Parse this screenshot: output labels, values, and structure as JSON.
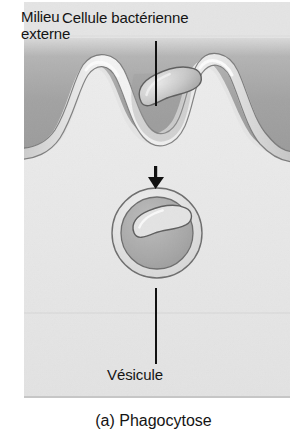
{
  "figure": {
    "name": "phagocytosis-diagram",
    "caption": "(a) Phagocytose",
    "panel": {
      "background_color": "#dedede",
      "external_medium_color": "#a8a8a8",
      "cytoplasm_color": "#e8e8e8",
      "membrane_color": "#efefef",
      "outline_color": "#6b6b6b"
    }
  },
  "labels": {
    "external_medium": "Milieu\nexterne",
    "bacterial_cell": "Cellule bactérienne",
    "vesicle": "Vésicule"
  },
  "annotations": {
    "leader_line_color": "#111111",
    "arrow_color": "#111111",
    "arrow_direction": "down"
  },
  "structures": {
    "pseudopod_left": "pseudopod-left",
    "pseudopod_right": "pseudopod-right",
    "phagocytic_cup": "phagocytic-cup",
    "bacterium_outside": "bacterium-in-cup",
    "vesicle_body": "phagosome",
    "bacterium_inside": "bacterium-in-vesicle"
  }
}
